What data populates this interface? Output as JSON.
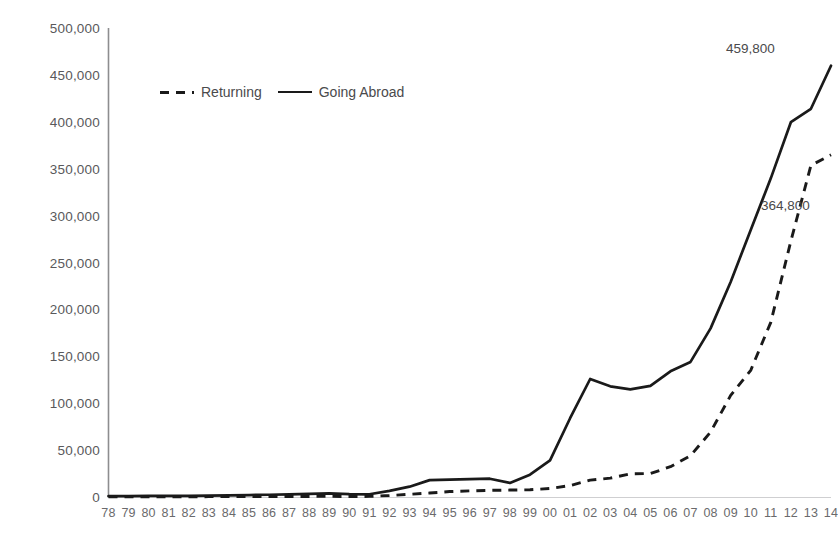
{
  "chart_data": {
    "type": "line",
    "title": "",
    "subtitle": "",
    "xlabel": "",
    "ylabel": "",
    "grid": false,
    "legend_position": "top-left-inside",
    "ylim": [
      0,
      500000
    ],
    "y_ticks": [
      0,
      50000,
      100000,
      150000,
      200000,
      250000,
      300000,
      350000,
      400000,
      450000,
      500000
    ],
    "y_tick_labels": [
      "0",
      "50,000",
      "100,000",
      "150,000",
      "200,000",
      "250,000",
      "300,000",
      "350,000",
      "400,000",
      "450,000",
      "500,000"
    ],
    "categories": [
      "78",
      "79",
      "80",
      "81",
      "82",
      "83",
      "84",
      "85",
      "86",
      "87",
      "88",
      "89",
      "90",
      "91",
      "92",
      "93",
      "94",
      "95",
      "96",
      "97",
      "98",
      "99",
      "00",
      "01",
      "02",
      "03",
      "04",
      "05",
      "06",
      "07",
      "08",
      "09",
      "10",
      "11",
      "12",
      "13",
      "14"
    ],
    "x_tick_labels": [
      "78",
      "79",
      "80",
      "81",
      "82",
      "83",
      "84",
      "85",
      "86",
      "87",
      "88",
      "89",
      "90",
      "91",
      "92",
      "93",
      "94",
      "95",
      "96",
      "97",
      "98",
      "99",
      "00",
      "01",
      "02",
      "03",
      "04",
      "05",
      "06",
      "07",
      "08",
      "09",
      "10",
      "11",
      "12",
      "13",
      "14"
    ],
    "series": [
      {
        "name": "Going Abroad",
        "style": "solid",
        "color": "#1a1a1a",
        "values": [
          860,
          1000,
          1100,
          1200,
          1300,
          1500,
          1800,
          2100,
          2400,
          2800,
          3300,
          3800,
          3000,
          2900,
          6500,
          11000,
          18000,
          18500,
          19000,
          19500,
          15000,
          23800,
          39000,
          84000,
          125800,
          118000,
          114700,
          118500,
          134000,
          144000,
          179800,
          229300,
          284700,
          339700,
          399600,
          413900,
          459800
        ]
      },
      {
        "name": "Returning",
        "style": "dashed",
        "color": "#1a1a1a",
        "values": [
          248,
          260,
          280,
          300,
          320,
          350,
          400,
          450,
          500,
          550,
          600,
          650,
          580,
          620,
          1600,
          2900,
          4200,
          5800,
          6500,
          7100,
          7400,
          7700,
          9100,
          12200,
          18000,
          20100,
          24700,
          25000,
          32300,
          44000,
          69300,
          108300,
          135000,
          186200,
          272900,
          353500,
          364800
        ]
      }
    ],
    "annotations": [
      {
        "series": "Going Abroad",
        "category": "14",
        "value": 459800,
        "label": "459,800"
      },
      {
        "series": "Returning",
        "category": "14",
        "value": 364800,
        "label": "364,800"
      }
    ]
  },
  "legend": {
    "entries": [
      {
        "label": "Returning",
        "style": "dashed"
      },
      {
        "label": "Going Abroad",
        "style": "solid"
      }
    ]
  }
}
